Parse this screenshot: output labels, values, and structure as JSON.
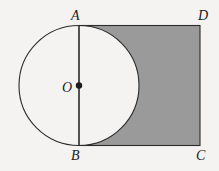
{
  "figure": {
    "background_color": "#f4f3f1",
    "stroke_color": "#2b2b2b",
    "shade_color": "#9a9a9a",
    "labels": {
      "A": "A",
      "B": "B",
      "C": "C",
      "D": "D",
      "O": "O"
    },
    "points": {
      "A": {
        "x": 79,
        "y": 25.5
      },
      "B": {
        "x": 79,
        "y": 145.5
      },
      "C": {
        "x": 200,
        "y": 145.5
      },
      "D": {
        "x": 200,
        "y": 25.5
      },
      "O": {
        "x": 79,
        "y": 85.5
      }
    },
    "circle": {
      "center_x": 79,
      "center_y": 85.5,
      "radius": 60
    },
    "rectangle": {
      "left": 79,
      "top": 25.5,
      "right": 200,
      "bottom": 145.5,
      "width": 121,
      "height": 120
    },
    "center_dot": {
      "x": 79,
      "y": 85.5,
      "radius": 3.2
    },
    "diameter_segment": {
      "from": "A",
      "to": "B"
    }
  }
}
